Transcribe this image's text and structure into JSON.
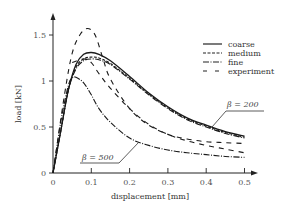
{
  "chart_data": {
    "type": "line",
    "title": "",
    "xlabel": "displacement [mm]",
    "ylabel": "load [kN]",
    "xlim": [
      0,
      0.5
    ],
    "ylim": [
      0,
      1.6
    ],
    "xticks": [
      "0",
      "0.1",
      "0.2",
      "0.3",
      "0.4",
      "0.5"
    ],
    "yticks": [
      "0",
      "0.5",
      "1",
      "1.5"
    ],
    "grid": false,
    "legend_position": "upper right",
    "legend": [
      "coarse",
      "medium",
      "fine",
      "experiment"
    ],
    "annotations": [
      "β = 200",
      "β = 500"
    ],
    "series": [
      {
        "name": "coarse (β = 200)",
        "style": "solid",
        "x": [
          0,
          0.02,
          0.04,
          0.06,
          0.08,
          0.1,
          0.12,
          0.15,
          0.2,
          0.25,
          0.3,
          0.35,
          0.4,
          0.45,
          0.5
        ],
        "y": [
          0,
          0.45,
          0.9,
          1.18,
          1.29,
          1.31,
          1.29,
          1.22,
          1.05,
          0.87,
          0.72,
          0.6,
          0.52,
          0.45,
          0.4
        ]
      },
      {
        "name": "medium (β = 200)",
        "style": "dashed",
        "x": [
          0,
          0.02,
          0.04,
          0.06,
          0.08,
          0.1,
          0.12,
          0.15,
          0.2,
          0.25,
          0.3,
          0.35,
          0.4,
          0.45,
          0.5
        ],
        "y": [
          0,
          0.45,
          0.9,
          1.15,
          1.24,
          1.26,
          1.25,
          1.19,
          1.03,
          0.86,
          0.71,
          0.59,
          0.51,
          0.44,
          0.39
        ]
      },
      {
        "name": "fine (β = 200)",
        "style": "dashdot",
        "x": [
          0,
          0.02,
          0.04,
          0.06,
          0.08,
          0.1,
          0.12,
          0.15,
          0.2,
          0.25,
          0.3,
          0.35,
          0.4,
          0.45,
          0.5
        ],
        "y": [
          0,
          0.45,
          0.9,
          1.13,
          1.22,
          1.24,
          1.23,
          1.18,
          1.02,
          0.85,
          0.7,
          0.58,
          0.5,
          0.43,
          0.38
        ]
      },
      {
        "name": "experiment 1",
        "style": "longdash",
        "x": [
          0,
          0.03,
          0.05,
          0.07,
          0.09,
          0.11,
          0.13,
          0.15,
          0.2,
          0.25,
          0.3,
          0.35,
          0.4,
          0.45,
          0.5
        ],
        "y": [
          0,
          0.85,
          1.3,
          1.5,
          1.57,
          1.5,
          1.25,
          1.02,
          0.7,
          0.52,
          0.42,
          0.37,
          0.34,
          0.33,
          0.32
        ]
      },
      {
        "name": "experiment 2",
        "style": "longdash",
        "x": [
          0.05,
          0.08,
          0.1,
          0.12,
          0.15,
          0.2,
          0.25,
          0.3,
          0.35,
          0.4,
          0.45,
          0.5
        ],
        "y": [
          1.2,
          1.24,
          1.2,
          1.08,
          0.92,
          0.7,
          0.53,
          0.42,
          0.35,
          0.3,
          0.26,
          0.22
        ]
      },
      {
        "name": "β = 500",
        "style": "dashdot",
        "x": [
          0,
          0.02,
          0.04,
          0.05,
          0.06,
          0.08,
          0.1,
          0.12,
          0.15,
          0.2,
          0.25,
          0.3,
          0.35,
          0.4,
          0.45,
          0.5
        ],
        "y": [
          0,
          0.55,
          0.95,
          1.03,
          1.04,
          0.98,
          0.85,
          0.7,
          0.55,
          0.38,
          0.3,
          0.25,
          0.22,
          0.2,
          0.18,
          0.17
        ]
      }
    ]
  },
  "labels": {
    "xlabel": "displacement [mm]",
    "ylabel": "load [kN]",
    "xticks": [
      "0",
      "0.1",
      "0.2",
      "0.3",
      "0.4",
      "0.5"
    ],
    "yticks": [
      "0",
      "0.5",
      "1",
      "1.5"
    ],
    "legend": [
      "coarse",
      "medium",
      "fine",
      "experiment"
    ],
    "beta200": "β = 200",
    "beta500": "β = 500"
  }
}
